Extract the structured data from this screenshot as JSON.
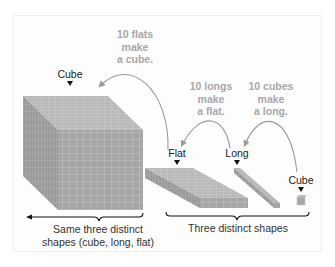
{
  "labels": {
    "cube_large": "Cube",
    "flat": "Flat",
    "long": "Long",
    "cube_small": "Cube"
  },
  "annotations": {
    "flats_to_cube": [
      "10 flats",
      "make",
      "a cube."
    ],
    "longs_to_flat": [
      "10 longs",
      "make",
      "a flat."
    ],
    "cubes_to_long": [
      "10 cubes",
      "make",
      "a long."
    ]
  },
  "captions": {
    "left": [
      "Same three distinct",
      "shapes (cube, long, flat)"
    ],
    "right": "Three distinct shapes"
  },
  "colors": {
    "block_face": "#a9a9a9",
    "grid_line": "#c8c8c8",
    "annotation_text": "#a8a8a8",
    "arrow": "#999999"
  }
}
